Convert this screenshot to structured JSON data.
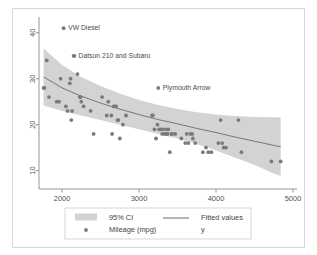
{
  "chart_data": {
    "type": "scatter",
    "title": "",
    "xlabel": "",
    "ylabel": "",
    "xlim": [
      1700,
      5000
    ],
    "ylim": [
      6,
      43
    ],
    "xticks": [
      2000,
      3000,
      4000,
      5000
    ],
    "yticks": [
      10,
      20,
      30,
      40
    ],
    "grid": false,
    "legend_position": "bottom",
    "series": [
      {
        "name": "95% CI",
        "type": "area",
        "color": "#d3d3d3",
        "x": [
          1760,
          2000,
          2250,
          2500,
          2750,
          3000,
          3250,
          3500,
          3750,
          4000,
          4250,
          4500,
          4750,
          4840
        ],
        "upper": [
          36.6,
          33.0,
          30.4,
          28.4,
          26.8,
          25.4,
          24.3,
          23.4,
          22.7,
          22.2,
          21.9,
          21.7,
          21.6,
          21.6
        ],
        "lower": [
          24.2,
          23.0,
          22.0,
          21.0,
          20.0,
          19.0,
          18.0,
          17.0,
          15.8,
          14.4,
          12.8,
          11.2,
          9.4,
          8.8
        ]
      },
      {
        "name": "Fitted values",
        "type": "line",
        "color": "#6b6b6b",
        "x": [
          1760,
          2000,
          2250,
          2500,
          2750,
          3000,
          3250,
          3500,
          3750,
          4000,
          4250,
          4500,
          4750,
          4840
        ],
        "y": [
          30.4,
          28.0,
          26.2,
          24.7,
          23.4,
          22.2,
          21.1,
          20.2,
          19.2,
          18.3,
          17.3,
          16.4,
          15.5,
          15.2
        ]
      },
      {
        "name": "Mileage (mpg)",
        "type": "scatter",
        "color": "#7a7a7a",
        "points": [
          [
            1760,
            28.0
          ],
          [
            1770,
            28.0
          ],
          [
            1800,
            34.0
          ],
          [
            1830,
            26.0
          ],
          [
            1930,
            25.0
          ],
          [
            1960,
            25.0
          ],
          [
            1980,
            30.0
          ],
          [
            2020,
            41.0
          ],
          [
            2050,
            24.0
          ],
          [
            2070,
            23.0
          ],
          [
            2100,
            29.0
          ],
          [
            2110,
            30.0
          ],
          [
            2120,
            21.0
          ],
          [
            2130,
            23.0
          ],
          [
            2150,
            35.0
          ],
          [
            2160,
            35.0
          ],
          [
            2200,
            31.0
          ],
          [
            2230,
            26.0
          ],
          [
            2240,
            26.0
          ],
          [
            2250,
            25.0
          ],
          [
            2280,
            24.0
          ],
          [
            2370,
            23.0
          ],
          [
            2410,
            18.0
          ],
          [
            2520,
            26.0
          ],
          [
            2580,
            22.0
          ],
          [
            2600,
            25.0
          ],
          [
            2640,
            22.0
          ],
          [
            2650,
            18.0
          ],
          [
            2670,
            24.0
          ],
          [
            2690,
            24.0
          ],
          [
            2700,
            24.0
          ],
          [
            2720,
            21.0
          ],
          [
            2730,
            21.0
          ],
          [
            2750,
            17.0
          ],
          [
            2790,
            20.0
          ],
          [
            2830,
            22.0
          ],
          [
            3170,
            22.0
          ],
          [
            3180,
            22.0
          ],
          [
            3200,
            19.0
          ],
          [
            3220,
            17.0
          ],
          [
            3240,
            20.0
          ],
          [
            3250,
            28.0
          ],
          [
            3260,
            19.0
          ],
          [
            3280,
            19.0
          ],
          [
            3300,
            18.0
          ],
          [
            3310,
            19.0
          ],
          [
            3330,
            18.0
          ],
          [
            3350,
            19.0
          ],
          [
            3360,
            18.0
          ],
          [
            3370,
            18.0
          ],
          [
            3380,
            19.0
          ],
          [
            3400,
            14.0
          ],
          [
            3420,
            18.0
          ],
          [
            3430,
            18.0
          ],
          [
            3470,
            18.0
          ],
          [
            3550,
            17.0
          ],
          [
            3600,
            16.0
          ],
          [
            3620,
            18.0
          ],
          [
            3640,
            16.0
          ],
          [
            3670,
            18.0
          ],
          [
            3690,
            18.0
          ],
          [
            3700,
            17.0
          ],
          [
            3730,
            16.0
          ],
          [
            3830,
            14.0
          ],
          [
            3870,
            15.0
          ],
          [
            3900,
            14.0
          ],
          [
            3940,
            14.0
          ],
          [
            4030,
            16.0
          ],
          [
            4060,
            21.0
          ],
          [
            4080,
            16.0
          ],
          [
            4100,
            15.0
          ],
          [
            4130,
            15.0
          ],
          [
            4290,
            21.0
          ],
          [
            4330,
            14.0
          ],
          [
            4720,
            12.0
          ],
          [
            4840,
            12.0
          ]
        ]
      }
    ],
    "annotations": [
      {
        "label": "VW Diesel",
        "x": 2020,
        "y": 41.0
      },
      {
        "label": "Datsun 210 and Subaru",
        "x": 2155,
        "y": 35.0
      },
      {
        "label": "Plymouth Arrow",
        "x": 3250,
        "y": 28.0
      }
    ]
  },
  "legend": {
    "items": [
      {
        "key": "ci-swatch",
        "label": "95% CI"
      },
      {
        "key": "line-swatch",
        "label": "Fitted values"
      },
      {
        "key": "marker-swatch",
        "label": "Mileage (mpg)"
      },
      {
        "key": "y-swatch",
        "label": "y"
      }
    ]
  },
  "axis": {
    "x_tick_labels": [
      "2000",
      "3000",
      "4000",
      "5000"
    ],
    "y_tick_labels": [
      "10",
      "20",
      "30",
      "40"
    ]
  },
  "colors": {
    "band": "#d3d3d3",
    "line": "#6b6b6b",
    "marker": "#7a7a7a",
    "axis": "#8a8a8a",
    "text": "#4a4a4a",
    "card_border": "#d8d8d8",
    "legend_border": "#cccccc"
  }
}
